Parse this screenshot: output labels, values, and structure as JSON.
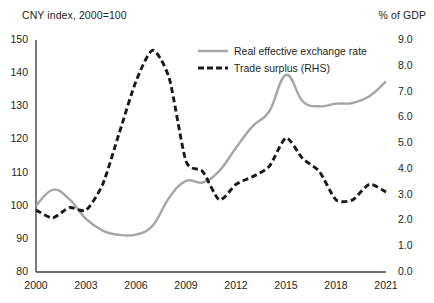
{
  "chart_data": {
    "type": "line",
    "title": "",
    "left_axis": {
      "label": "CNY index, 2000=100",
      "ticks": [
        "150",
        "140",
        "130",
        "120",
        "110",
        "100",
        "90",
        "80"
      ],
      "min": 80,
      "max": 150,
      "step": 10
    },
    "right_axis": {
      "label": "% of GDP",
      "ticks": [
        "9.0",
        "8.0",
        "7.0",
        "6.0",
        "5.0",
        "4.0",
        "3.0",
        "2.0",
        "1.0",
        "0.0"
      ],
      "min": 0.0,
      "max": 9.0,
      "step": 1.0
    },
    "xlabel": "",
    "x": [
      2000,
      2001,
      2002,
      2003,
      2004,
      2005,
      2006,
      2007,
      2008,
      2009,
      2010,
      2011,
      2012,
      2013,
      2014,
      2015,
      2016,
      2017,
      2018,
      2019,
      2020,
      2021
    ],
    "x_ticks": [
      "2000",
      "2003",
      "2006",
      "2009",
      "2012",
      "2015",
      "2018",
      "2021"
    ],
    "xlim": [
      2000,
      2021
    ],
    "grid": false,
    "legend_position": "inside-top-right",
    "series": [
      {
        "name": "Real effective exchange rate",
        "axis": "left",
        "style": "solid",
        "color": "#a6a6a6",
        "values": [
          100.0,
          104.8,
          102.0,
          96.0,
          92.5,
          91.2,
          91.3,
          94.0,
          102.5,
          107.5,
          107.0,
          110.5,
          117.5,
          124.0,
          128.5,
          139.5,
          131.5,
          130.0,
          130.8,
          131.0,
          133.0,
          137.5
        ]
      },
      {
        "name": "Trade surplus (RHS)",
        "axis": "right",
        "style": "dashed",
        "color": "#1a1a1a",
        "values": [
          2.4,
          2.1,
          2.5,
          2.4,
          3.4,
          5.4,
          7.4,
          8.6,
          7.5,
          4.3,
          3.9,
          2.8,
          3.4,
          3.7,
          4.1,
          5.2,
          4.4,
          3.9,
          2.8,
          2.8,
          3.4,
          3.1
        ]
      }
    ]
  },
  "legend": {
    "items": [
      {
        "label": "Real effective exchange rate"
      },
      {
        "label": "Trade surplus (RHS)"
      }
    ]
  },
  "colors": {
    "reer": "#a6a6a6",
    "trade": "#1a1a1a",
    "axis": "#404040",
    "text": "#231f20"
  }
}
